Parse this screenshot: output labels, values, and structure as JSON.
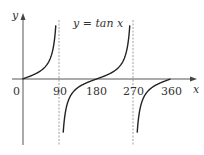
{
  "chart_data": {
    "type": "line",
    "title": "y = tan x",
    "xlabel": "x",
    "ylabel": "y",
    "origin_label": "0",
    "x_ticks": [
      "90",
      "180",
      "270",
      "360"
    ],
    "asymptotes": [
      90,
      270
    ],
    "xlim": [
      0,
      360
    ],
    "grid": false,
    "legend": "none",
    "series": [
      {
        "name": "tan x",
        "x": [
          0,
          30,
          60,
          80,
          100,
          120,
          150,
          180,
          210,
          240,
          260,
          280,
          300,
          330,
          360
        ],
        "values": [
          0,
          0.58,
          1.73,
          5.67,
          -5.67,
          -1.73,
          -0.58,
          0,
          0.58,
          1.73,
          5.67,
          -5.67,
          -1.73,
          -0.58,
          0
        ]
      }
    ],
    "colors": {
      "curve": "#222222",
      "axis": "#444444",
      "asymptote": "#777777"
    }
  }
}
